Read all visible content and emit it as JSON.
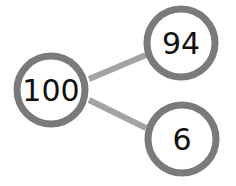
{
  "diagram": {
    "type": "number-bond",
    "colors": {
      "circle_stroke": "#7a7a7a",
      "connector": "#a3a3a3",
      "text": "#111111",
      "background": "#ffffff"
    },
    "whole": {
      "value": "100"
    },
    "parts": [
      {
        "value": "94"
      },
      {
        "value": "6"
      }
    ]
  }
}
